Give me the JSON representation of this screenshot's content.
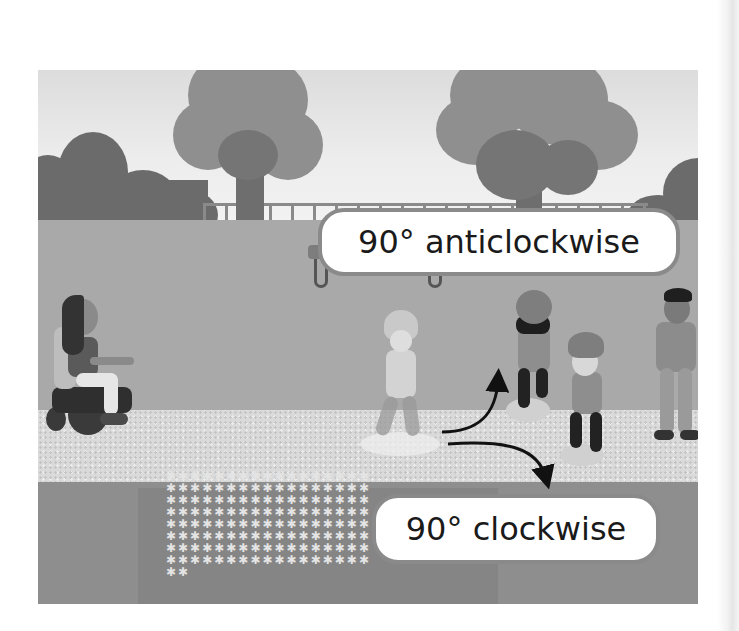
{
  "scene": {
    "description": "Grayscale illustration of a park: children on hoverboards turning on a path, a girl in a wheelchair, a boy standing, trees, bushes, fence, bench and flowerbed",
    "labels": {
      "anticlockwise": "90° anticlockwise",
      "clockwise": "90° clockwise"
    },
    "arrows": [
      {
        "direction": "anticlockwise",
        "angle_deg": 90
      },
      {
        "direction": "clockwise",
        "angle_deg": 90
      }
    ]
  },
  "colors": {
    "label_bg": "#ffffff",
    "label_border": "#8a8a8a",
    "label_text": "#1a1a1a",
    "lawn": "#a9a9a9",
    "path": "#dadada",
    "flowerbed": "#8e8e8e"
  },
  "flower_glyphs": "✱✱✱✱✱✱✱✱✱✱✱✱✱✱✱✱✱✱✱✱✱✱✱✱✱✱✱✱✱✱✱✱✱✱✱✱✱✱✱✱✱✱✱✱✱✱✱✱✱✱✱✱✱✱✱✱✱✱✱✱✱✱✱✱✱✱✱✱✱✱✱✱✱✱✱✱✱✱✱✱✱✱✱✱✱✱✱✱✱✱✱✱✱✱✱✱✱✱✱✱✱✱✱✱✱✱✱✱✱✱✱✱✱✱✱✱✱✱✱✱✱✱✱✱✱✱✱✱✱✱✱✱✱✱✱✱✱✱"
}
